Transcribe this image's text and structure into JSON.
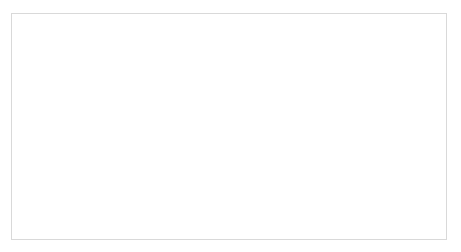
{
  "chart_data": {
    "type": "line",
    "title": "",
    "xlabel": "",
    "ylabel": "",
    "ylim": [
      0,
      450
    ],
    "yticks": [
      0,
      50,
      100,
      150,
      200,
      250,
      300,
      350,
      400,
      450
    ],
    "grid": true,
    "legend_position": "bottom",
    "categories": [
      "1980",
      "1982",
      "1984",
      "1986",
      "1988",
      "1990",
      "1992",
      "1994",
      "1996",
      "2000",
      "2002",
      "2007",
      "2009",
      "2011",
      "2013"
    ],
    "series": [
      {
        "name": "Poland",
        "style": "solid",
        "values": [
          105,
          103,
          100,
          100,
          103,
          112,
          117,
          118,
          118,
          200,
          185,
          170,
          148,
          140,
          105
        ]
      },
      {
        "name": "Bulgaria",
        "style": "dash-dot",
        "values": [
          262,
          290,
          318,
          418,
          368,
          362,
          372,
          370,
          352,
          310,
          295,
          205,
          175,
          168,
          152
        ]
      },
      {
        "name": "Portugal",
        "style": "dashed",
        "values": [
          126,
          120,
          116,
          113,
          112,
          115,
          118,
          118,
          116,
          100,
          108,
          82,
          75,
          70,
          62
        ]
      },
      {
        "name": "Greece",
        "style": "dotted",
        "values": [
          85,
          88,
          92,
          96,
          100,
          108,
          115,
          118,
          118,
          120,
          120,
          100,
          88,
          80,
          68
        ]
      }
    ]
  },
  "legend": {
    "items": [
      {
        "label": "Poland"
      },
      {
        "label": "Bulgaria"
      },
      {
        "label": "Portugal"
      },
      {
        "label": "Greece"
      }
    ]
  }
}
